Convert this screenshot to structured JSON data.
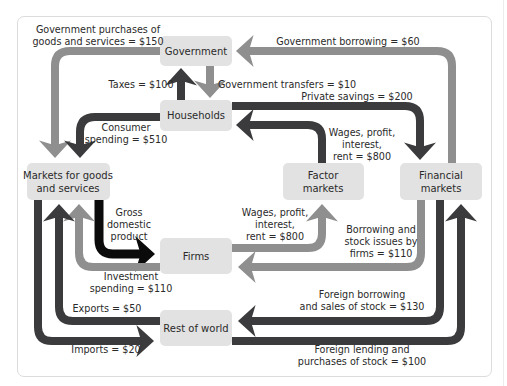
{
  "diagram": {
    "colors": {
      "box_fill": "#e2e2e2",
      "dark_flow": "#3b3b3d",
      "gray_flow": "#8f8f8f",
      "gdp_flow": "#0b0b0b"
    },
    "nodes": {
      "government": "Government",
      "households": "Households",
      "markets_line1": "Markets for goods",
      "markets_line2": "and services",
      "factor_line1": "Factor",
      "factor_line2": "markets",
      "financial_line1": "Financial",
      "financial_line2": "markets",
      "firms": "Firms",
      "rest_of_world": "Rest of world"
    },
    "flows": {
      "gov_purchases_l1": "Government purchases of",
      "gov_purchases_l2": "goods and services = $150",
      "gov_borrowing": "Government borrowing = $60",
      "taxes": "Taxes = $100",
      "gov_transfers": "Government transfers = $10",
      "private_savings": "Private savings = $200",
      "consumer_spending_l1": "Consumer",
      "consumer_spending_l2": "spending = $510",
      "wages_hh_l1": "Wages, profit,",
      "wages_hh_l2": "interest,",
      "wages_hh_l3": "rent = $800",
      "gdp_l1": "Gross",
      "gdp_l2": "domestic",
      "gdp_l3": "product",
      "wages_firms_l1": "Wages, profit,",
      "wages_firms_l2": "interest,",
      "wages_firms_l3": "rent = $800",
      "borrowing_firms_l1": "Borrowing and",
      "borrowing_firms_l2": "stock issues by",
      "borrowing_firms_l3": "firms = $110",
      "investment_l1": "Investment",
      "investment_l2": "spending = $110",
      "exports": "Exports = $50",
      "imports": "Imports = $20",
      "foreign_borrowing_l1": "Foreign borrowing",
      "foreign_borrowing_l2": "and sales of stock = $130",
      "foreign_lending_l1": "Foreign lending and",
      "foreign_lending_l2": "purchases of stock = $100"
    }
  }
}
